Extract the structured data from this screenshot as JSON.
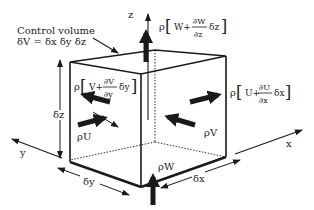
{
  "labels": {
    "control_volume": "Control volume",
    "volume_eq": "δV = δx δy δz",
    "axis_x": "x",
    "axis_y": "y",
    "axis_z": "z",
    "dim_x": "δx",
    "dim_y": "δy",
    "dim_z": "δz",
    "flux_u_in": "ρU",
    "flux_v_in": "ρV",
    "flux_w_in": "ρW",
    "flux_u_out": {
      "rho": "ρ",
      "base": "U+",
      "num": "∂U",
      "den": "∂x",
      "tail": "δx"
    },
    "flux_v_out": {
      "rho": "ρ",
      "base": "V+",
      "num": "∂V",
      "den": "∂y",
      "tail": "δy"
    },
    "flux_w_out": {
      "rho": "ρ",
      "base": "W+",
      "num": "∂W",
      "den": "∂z",
      "tail": "δz"
    }
  },
  "colors": {
    "ink": "#1a1a1a",
    "background": "#ffffff"
  }
}
